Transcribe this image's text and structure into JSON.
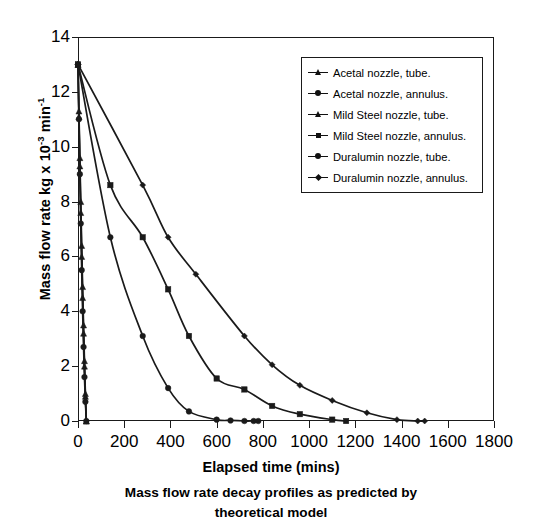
{
  "figure": {
    "caption_line1": "Mass flow rate decay profiles as predicted by",
    "caption_line2": "theoretical model"
  },
  "axes": {
    "xlabel": "Elapsed time (mins)",
    "ylabel_pre": "Mass flow rate kg x 10",
    "ylabel_sup1": "-3",
    "ylabel_mid": " min",
    "ylabel_sup2": "-1",
    "xticks": [
      "0",
      "200",
      "400",
      "600",
      "800",
      "1000",
      "1200",
      "1400",
      "1600",
      "1800"
    ],
    "yticks": [
      "0",
      "2",
      "4",
      "6",
      "8",
      "10",
      "12",
      "14"
    ]
  },
  "legend": {
    "entries": [
      {
        "label": "Acetal nozzle, tube.",
        "marker": "tri"
      },
      {
        "label": "Acetal nozzle, annulus.",
        "marker": "dot"
      },
      {
        "label": "Mild Steel nozzle, tube.",
        "marker": "tri"
      },
      {
        "label": "Mild Steel nozzle, annulus.",
        "marker": "sq"
      },
      {
        "label": "Duralumin nozzle, tube.",
        "marker": "dot"
      },
      {
        "label": "Duralumin nozzle, annulus.",
        "marker": "dia"
      }
    ]
  },
  "chart_data": {
    "type": "line",
    "title": "Mass flow rate decay profiles as predicted by theoretical model",
    "xlabel": "Elapsed time (mins)",
    "ylabel": "Mass flow rate kg x 10-3 min-1",
    "xlim": [
      0,
      1800
    ],
    "ylim": [
      0,
      14
    ],
    "xtick_interval": 200,
    "ytick_interval": 2,
    "grid": false,
    "legend_position": "upper-right",
    "line_color": "#1a1a1a",
    "series": [
      {
        "name": "Acetal nozzle, tube.",
        "marker": "triangle",
        "x": [
          0,
          4,
          8,
          12,
          16,
          20,
          24,
          28,
          32,
          36
        ],
        "y": [
          13.0,
          11.1,
          9.3,
          7.6,
          6.0,
          4.5,
          3.2,
          2.0,
          0.9,
          0.0
        ]
      },
      {
        "name": "Acetal nozzle, annulus.",
        "marker": "circle",
        "x": [
          0,
          140,
          280,
          390,
          480,
          600,
          660,
          720,
          760,
          780
        ],
        "y": [
          13.0,
          6.7,
          3.1,
          1.2,
          0.35,
          0.05,
          0.02,
          0.0,
          0.0,
          0.0
        ]
      },
      {
        "name": "Mild Steel nozzle, tube.",
        "marker": "triangle",
        "x": [
          0,
          4,
          8,
          12,
          16,
          20,
          24,
          28,
          32,
          36
        ],
        "y": [
          13.0,
          11.3,
          9.6,
          8.0,
          6.4,
          4.9,
          3.5,
          2.2,
          1.0,
          0.0
        ]
      },
      {
        "name": "Mild Steel nozzle, annulus.",
        "marker": "square",
        "x": [
          0,
          140,
          280,
          390,
          480,
          600,
          720,
          840,
          960,
          1100,
          1160
        ],
        "y": [
          13.0,
          8.6,
          6.7,
          4.8,
          3.1,
          1.55,
          1.15,
          0.55,
          0.25,
          0.05,
          0.0
        ]
      },
      {
        "name": "Duralumin nozzle, tube.",
        "marker": "circle",
        "x": [
          0,
          4,
          8,
          12,
          16,
          20,
          24,
          28,
          32,
          36
        ],
        "y": [
          13.0,
          11.0,
          9.0,
          7.2,
          5.5,
          4.0,
          2.7,
          1.6,
          0.7,
          0.0
        ]
      },
      {
        "name": "Duralumin nozzle, annulus.",
        "marker": "diamond",
        "x": [
          0,
          280,
          390,
          510,
          720,
          840,
          960,
          1100,
          1250,
          1380,
          1470,
          1500
        ],
        "y": [
          13.0,
          8.6,
          6.7,
          5.35,
          3.1,
          2.05,
          1.3,
          0.75,
          0.3,
          0.05,
          0.0,
          0.0
        ]
      }
    ]
  }
}
